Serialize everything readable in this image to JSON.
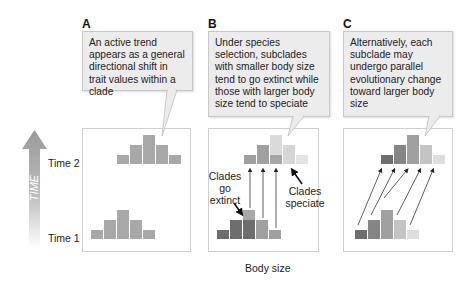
{
  "panels": {
    "a": {
      "label": "A",
      "callout": "An active trend appears as a general directional shift in trait values within a clade"
    },
    "b": {
      "label": "B",
      "callout": "Under species selection, subclades with smaller body size tend to go extinct while those with larger body size tend to speciate",
      "annotation_extinct": "Clades go extinct",
      "annotation_speciate": "Clades speciate"
    },
    "c": {
      "label": "C",
      "callout": "Alternatively, each subclade may undergo parallel evolutionary change toward larger body size"
    }
  },
  "axis": {
    "time_label": "TIME",
    "time1": "Time 1",
    "time2": "Time 2",
    "x_label": "Body size"
  },
  "colors": {
    "uniform_bar": "#a8a8a8",
    "shade1": "#6e6e6e",
    "shade2": "#858585",
    "shade3": "#a0a0a0",
    "shade4": "#c4c4c4",
    "shade5": "#dedede"
  }
}
